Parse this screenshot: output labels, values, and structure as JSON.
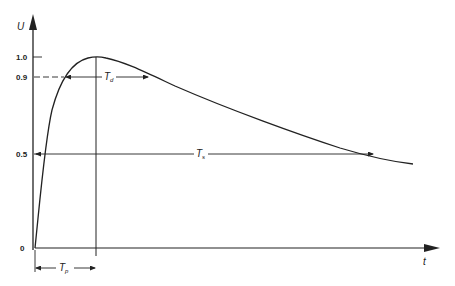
{
  "diagram": {
    "type": "impulse-waveform",
    "axes": {
      "y_label": "U",
      "x_label": "t",
      "y_ticks": [
        "1.0",
        "0.9",
        "0.5",
        "0"
      ]
    },
    "annotations": {
      "front_time": "T",
      "front_time_sub": "p",
      "duration_above_09": "T",
      "duration_above_09_sub": "d",
      "half_value_time": "T",
      "half_value_time_sub": "s"
    },
    "colors": {
      "line": "#222222",
      "background": "#ffffff"
    }
  }
}
